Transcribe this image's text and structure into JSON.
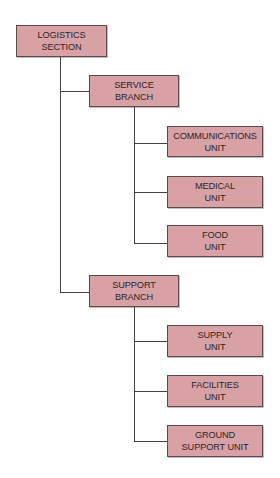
{
  "diagram": {
    "type": "org-chart",
    "colors": {
      "box_fill": "#d8a1a6",
      "box_border": "#5c4a4c",
      "line": "#4a4344",
      "text": "#2e2526"
    },
    "root": {
      "line1": "LOGISTICS",
      "line2": "SECTION"
    },
    "branches": [
      {
        "line1": "SERVICE",
        "line2": "BRANCH",
        "units": [
          {
            "line1": "COMMUNICATIONS",
            "line2": "UNIT"
          },
          {
            "line1": "MEDICAL",
            "line2": "UNIT"
          },
          {
            "line1": "FOOD",
            "line2": "UNIT"
          }
        ]
      },
      {
        "line1": "SUPPORT",
        "line2": "BRANCH",
        "units": [
          {
            "line1": "SUPPLY",
            "line2": "UNIT"
          },
          {
            "line1": "FACILITIES",
            "line2": "UNIT"
          },
          {
            "line1": "GROUND",
            "line2": "SUPPORT UNIT"
          }
        ]
      }
    ]
  }
}
